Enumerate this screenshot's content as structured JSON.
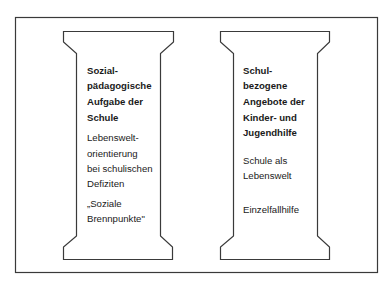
{
  "colors": {
    "stroke": "#3a3a3a",
    "text": "#1a1a1a",
    "background": "#ffffff"
  },
  "pillars": [
    {
      "heading_lines": [
        "Sozial-",
        "pädagogische",
        "Aufgabe der",
        "Schule"
      ],
      "body_groups": [
        [
          "Lebenswelt-",
          "orientierung",
          "bei schulischen",
          "Defiziten"
        ],
        [
          "„Soziale",
          "Brennpunkte\""
        ]
      ]
    },
    {
      "heading_lines": [
        "Schul-",
        "bezogene",
        "Angebote der",
        "Kinder- und",
        "Jugendhilfe"
      ],
      "body_groups": [
        [
          "Schule als",
          "Lebenswelt"
        ],
        [
          "Einzelfallhilfe"
        ]
      ]
    }
  ]
}
